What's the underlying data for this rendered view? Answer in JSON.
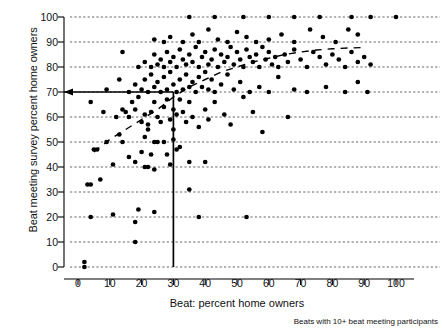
{
  "axes": {
    "xlabel": "Beat: percent home owners",
    "ylabel": "Beat meeting survey percent home owners",
    "caption": "Beats with 10+ beat meeting participants",
    "xticks": [
      "0",
      "10",
      "20",
      "30",
      "40",
      "50",
      "60",
      "70",
      "80",
      "90",
      "100"
    ],
    "yticks": [
      "0",
      "10",
      "20",
      "30",
      "40",
      "50",
      "60",
      "70",
      "80",
      "90",
      "100"
    ]
  },
  "chart_data": {
    "type": "scatter",
    "title": "",
    "xlabel": "Beat: percent home owners",
    "ylabel": "Beat meeting survey percent home owners",
    "annotation": "Beats with 10+ beat meeting participants",
    "xlim": [
      0,
      100
    ],
    "ylim": [
      0,
      100
    ],
    "xticks": [
      0,
      10,
      20,
      30,
      40,
      50,
      60,
      70,
      80,
      90,
      100
    ],
    "yticks": [
      0,
      10,
      20,
      30,
      40,
      50,
      60,
      70,
      80,
      90,
      100
    ],
    "grid": "horizontal-dashed",
    "legend": "none",
    "reference_lines": {
      "vertical_x": 30,
      "horizontal_y": 70,
      "arrow": "left-pointing at y=70 on y-axis",
      "style": "solid-black"
    },
    "trend_line": {
      "name": "lowess smooth",
      "style": "dashed",
      "x": [
        5,
        10,
        15,
        20,
        25,
        30,
        35,
        40,
        45,
        50,
        55,
        60,
        65,
        70,
        75,
        80,
        85,
        90
      ],
      "y": [
        46,
        51,
        55,
        59,
        63,
        68,
        72,
        75,
        78,
        80,
        82,
        83.5,
        85,
        86,
        86.8,
        87.3,
        87.6,
        87.8
      ]
    },
    "points": [
      [
        2,
        0
      ],
      [
        2,
        2
      ],
      [
        4,
        20
      ],
      [
        4,
        33
      ],
      [
        3,
        33
      ],
      [
        7,
        35
      ],
      [
        11,
        21
      ],
      [
        11,
        41
      ],
      [
        18,
        10
      ],
      [
        18,
        18
      ],
      [
        19,
        23
      ],
      [
        24,
        22
      ],
      [
        18,
        42
      ],
      [
        21,
        40
      ],
      [
        22,
        40
      ],
      [
        24,
        39
      ],
      [
        29,
        41
      ],
      [
        35,
        42
      ],
      [
        35,
        31
      ],
      [
        38,
        20
      ],
      [
        53,
        20
      ],
      [
        40,
        42
      ],
      [
        5,
        47
      ],
      [
        6,
        47
      ],
      [
        9,
        50
      ],
      [
        13,
        53
      ],
      [
        14,
        50
      ],
      [
        16,
        44
      ],
      [
        20,
        46
      ],
      [
        21,
        52
      ],
      [
        22,
        55
      ],
      [
        23,
        45
      ],
      [
        24,
        50
      ],
      [
        25,
        50
      ],
      [
        27,
        50
      ],
      [
        28,
        45
      ],
      [
        30,
        51
      ],
      [
        30,
        55
      ],
      [
        31,
        47
      ],
      [
        32,
        48
      ],
      [
        4,
        66
      ],
      [
        8,
        62
      ],
      [
        12,
        60
      ],
      [
        14,
        63
      ],
      [
        15,
        62
      ],
      [
        16,
        60
      ],
      [
        17,
        66
      ],
      [
        18,
        63
      ],
      [
        19,
        68
      ],
      [
        20,
        58
      ],
      [
        21,
        61
      ],
      [
        22,
        57
      ],
      [
        23,
        62
      ],
      [
        24,
        66
      ],
      [
        25,
        60
      ],
      [
        26,
        58
      ],
      [
        27,
        64
      ],
      [
        28,
        67
      ],
      [
        29,
        59
      ],
      [
        30,
        63
      ],
      [
        31,
        61
      ],
      [
        32,
        67
      ],
      [
        33,
        62
      ],
      [
        34,
        58
      ],
      [
        35,
        66
      ],
      [
        36,
        60
      ],
      [
        38,
        56
      ],
      [
        40,
        63
      ],
      [
        41,
        59
      ],
      [
        43,
        66
      ],
      [
        46,
        61
      ],
      [
        48,
        57
      ],
      [
        52,
        68
      ],
      [
        55,
        62
      ],
      [
        58,
        54
      ],
      [
        66,
        60
      ],
      [
        9,
        71
      ],
      [
        13,
        75
      ],
      [
        16,
        70
      ],
      [
        18,
        73
      ],
      [
        20,
        71
      ],
      [
        21,
        75
      ],
      [
        22,
        70
      ],
      [
        23,
        77
      ],
      [
        24,
        72
      ],
      [
        25,
        74
      ],
      [
        26,
        70
      ],
      [
        27,
        76
      ],
      [
        28,
        71
      ],
      [
        29,
        78
      ],
      [
        30,
        73
      ],
      [
        31,
        70
      ],
      [
        32,
        75
      ],
      [
        33,
        71
      ],
      [
        34,
        77
      ],
      [
        35,
        72
      ],
      [
        36,
        74
      ],
      [
        37,
        70
      ],
      [
        38,
        76
      ],
      [
        39,
        72
      ],
      [
        40,
        78
      ],
      [
        41,
        71
      ],
      [
        42,
        75
      ],
      [
        43,
        70
      ],
      [
        45,
        73
      ],
      [
        47,
        77
      ],
      [
        49,
        71
      ],
      [
        51,
        74
      ],
      [
        54,
        70
      ],
      [
        57,
        72
      ],
      [
        60,
        70
      ],
      [
        63,
        76
      ],
      [
        68,
        71
      ],
      [
        72,
        70
      ],
      [
        78,
        72
      ],
      [
        84,
        70
      ],
      [
        88,
        74
      ],
      [
        91,
        70
      ],
      [
        14,
        86
      ],
      [
        19,
        80
      ],
      [
        21,
        82
      ],
      [
        23,
        80
      ],
      [
        24,
        85
      ],
      [
        25,
        81
      ],
      [
        26,
        83
      ],
      [
        27,
        80
      ],
      [
        28,
        86
      ],
      [
        29,
        82
      ],
      [
        30,
        84
      ],
      [
        31,
        80
      ],
      [
        32,
        87
      ],
      [
        33,
        83
      ],
      [
        34,
        81
      ],
      [
        35,
        85
      ],
      [
        36,
        82
      ],
      [
        37,
        88
      ],
      [
        38,
        80
      ],
      [
        39,
        84
      ],
      [
        40,
        86
      ],
      [
        41,
        81
      ],
      [
        42,
        83
      ],
      [
        43,
        87
      ],
      [
        44,
        80
      ],
      [
        45,
        85
      ],
      [
        46,
        82
      ],
      [
        47,
        84
      ],
      [
        48,
        88
      ],
      [
        49,
        81
      ],
      [
        50,
        86
      ],
      [
        51,
        83
      ],
      [
        52,
        80
      ],
      [
        53,
        87
      ],
      [
        54,
        84
      ],
      [
        55,
        82
      ],
      [
        56,
        85
      ],
      [
        57,
        80
      ],
      [
        58,
        88
      ],
      [
        59,
        83
      ],
      [
        60,
        86
      ],
      [
        61,
        81
      ],
      [
        62,
        84
      ],
      [
        63,
        80
      ],
      [
        65,
        85
      ],
      [
        66,
        82
      ],
      [
        68,
        87
      ],
      [
        70,
        83
      ],
      [
        72,
        80
      ],
      [
        74,
        86
      ],
      [
        76,
        84
      ],
      [
        78,
        81
      ],
      [
        80,
        85
      ],
      [
        82,
        83
      ],
      [
        84,
        80
      ],
      [
        86,
        86
      ],
      [
        88,
        82
      ],
      [
        90,
        84
      ],
      [
        92,
        81
      ],
      [
        24,
        91
      ],
      [
        27,
        90
      ],
      [
        29,
        92
      ],
      [
        33,
        90
      ],
      [
        36,
        93
      ],
      [
        38,
        90
      ],
      [
        41,
        95
      ],
      [
        44,
        91
      ],
      [
        47,
        90
      ],
      [
        50,
        94
      ],
      [
        53,
        92
      ],
      [
        56,
        90
      ],
      [
        60,
        91
      ],
      [
        64,
        93
      ],
      [
        68,
        90
      ],
      [
        73,
        95
      ],
      [
        77,
        92
      ],
      [
        81,
        90
      ],
      [
        85,
        95
      ],
      [
        88,
        93
      ],
      [
        35,
        100
      ],
      [
        43,
        100
      ],
      [
        52,
        100
      ],
      [
        60,
        100
      ],
      [
        68,
        100
      ],
      [
        76,
        100
      ],
      [
        86,
        100
      ],
      [
        92,
        100
      ],
      [
        100,
        100
      ]
    ]
  }
}
